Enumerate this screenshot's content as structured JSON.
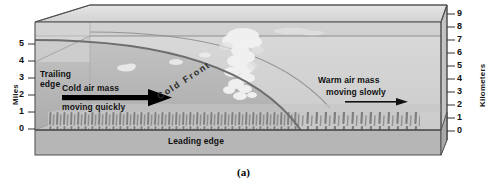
{
  "figure": {
    "caption": "(a)"
  },
  "axes": {
    "left": {
      "title": "Miles",
      "ticks": [
        "5",
        "4",
        "3",
        "2",
        "1",
        "0"
      ],
      "min": 0,
      "max": 5
    },
    "right": {
      "title": "Kilometers",
      "ticks": [
        "9",
        "8",
        "7",
        "6",
        "5",
        "4",
        "3",
        "2",
        "1",
        "0"
      ],
      "min": 0,
      "max": 9
    }
  },
  "labels": {
    "trailing_edge": "Trailing\nedge",
    "trailing_edge_line1": "Trailing",
    "trailing_edge_line2": "edge",
    "leading_edge": "Leading edge",
    "cold_front": "Cold Front",
    "cold_air_gray": "Cold air ",
    "cold_air_bold": "mass",
    "cold_air_line2": "moving quickly",
    "warm_air_gray": "Warm air ",
    "warm_air_bold": "mass",
    "warm_air_line2": "moving slowly"
  },
  "colors": {
    "warm_air": "#d0d0d0",
    "cold_air": "#b4b4b4",
    "box_top": "#dcdcdc",
    "ground": "#b9b9b9",
    "ground_side": "#a8a8a8",
    "front_line": "#6b6b6b",
    "outline": "#555555",
    "cloud": "#f4f4f4",
    "precip": "#8b8b8b",
    "text": "#111111",
    "text_gray": "#8a8a8a",
    "arrow_cold": "#000000",
    "arrow_warm": "#000000"
  },
  "elements": {
    "cloud_name": "cumulonimbus-cloud",
    "precipitation_name": "precipitation-streaks",
    "cold_arrow_name": "cold-air-arrow",
    "warm_arrow_name": "warm-air-arrow"
  }
}
